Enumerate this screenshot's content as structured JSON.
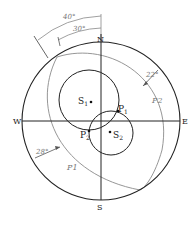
{
  "diagram": {
    "type": "stereographic-projection",
    "compass": {
      "north": "N",
      "south": "S",
      "east": "E",
      "west": "W"
    },
    "great_circles": [
      {
        "name": "P1",
        "label": "P1",
        "dip_label": "28°"
      },
      {
        "name": "P2",
        "label": "P2",
        "dip_label": "22°"
      }
    ],
    "small_circles": [
      {
        "name": "S1",
        "label_main": "S",
        "label_sub": "1"
      },
      {
        "name": "S2",
        "label_main": "S",
        "label_sub": "2"
      }
    ],
    "intersections": [
      {
        "name": "P1",
        "label_main": "P",
        "label_sub": "1"
      },
      {
        "name": "P2",
        "label_main": "P",
        "label_sub": "2"
      }
    ],
    "angle_arcs": [
      {
        "label": "40°"
      },
      {
        "label": "30°"
      }
    ],
    "colors": {
      "primary": "#222222",
      "secondary": "#8a8a8a"
    }
  }
}
